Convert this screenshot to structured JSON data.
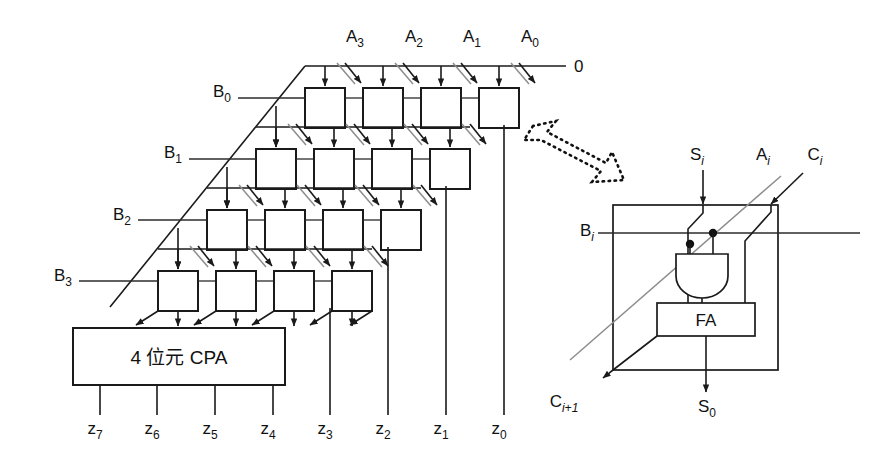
{
  "figure": {
    "type": "logic-block-diagram"
  },
  "array": {
    "a_inputs": [
      "A",
      "A",
      "A",
      "A"
    ],
    "a_labels": [
      {
        "base": "A",
        "sub": "3",
        "x": 355,
        "y": 42
      },
      {
        "base": "A",
        "sub": "2",
        "x": 414,
        "y": 42
      },
      {
        "base": "A",
        "sub": "1",
        "x": 472,
        "y": 42
      },
      {
        "base": "A",
        "sub": "0",
        "x": 530,
        "y": 42
      }
    ],
    "b_labels": [
      {
        "base": "B",
        "sub": "0",
        "x": 222,
        "y": 97
      },
      {
        "base": "B",
        "sub": "1",
        "x": 173,
        "y": 158
      },
      {
        "base": "B",
        "sub": "2",
        "x": 122,
        "y": 220
      },
      {
        "base": "B",
        "sub": "3",
        "x": 63,
        "y": 281
      }
    ],
    "carry_in_label": "0",
    "carry_in_x": 566,
    "carry_in_y": 66,
    "rows": 4,
    "cols": 4,
    "cell_size": 40,
    "row_pitch": 61,
    "col_pitch": 58,
    "row_x_offset": -49,
    "row0_x": 305,
    "row0_y": 88
  },
  "cpa": {
    "label": "4 位元 CPA",
    "x": 73,
    "y": 328,
    "width": 212,
    "height": 57
  },
  "outputs": {
    "labels": [
      {
        "base": "z",
        "sub": "7",
        "x": 95,
        "y": 434,
        "line_x": 100,
        "line_top": 385
      },
      {
        "base": "z",
        "sub": "6",
        "x": 152,
        "y": 434,
        "line_x": 157,
        "line_top": 385
      },
      {
        "base": "z",
        "sub": "5",
        "x": 210,
        "y": 434,
        "line_x": 215,
        "line_top": 385
      },
      {
        "base": "z",
        "sub": "4",
        "x": 268,
        "y": 434,
        "line_x": 273,
        "line_top": 385
      },
      {
        "base": "z",
        "sub": "3",
        "x": 325,
        "y": 434,
        "line_x": 330,
        "line_top": 308
      },
      {
        "base": "z",
        "sub": "2",
        "x": 383,
        "y": 434,
        "line_x": 388,
        "line_top": 247
      },
      {
        "base": "z",
        "sub": "1",
        "x": 441,
        "y": 434,
        "line_x": 446,
        "line_top": 186
      },
      {
        "base": "z",
        "sub": "0",
        "x": 499,
        "y": 434,
        "line_x": 504,
        "line_top": 125
      }
    ]
  },
  "callout": {
    "arrow_name": "zoom-callout-arrow",
    "from_x": 530,
    "from_y": 130,
    "to_x": 625,
    "to_y": 175
  },
  "cell_detail": {
    "box": {
      "x": 613,
      "y": 205,
      "width": 165,
      "height": 165
    },
    "fa_label": "FA",
    "fa_box": {
      "x": 657,
      "y": 303,
      "width": 98,
      "height": 33
    },
    "and_gate": {
      "x": 676,
      "y": 254,
      "width": 52,
      "height": 44
    },
    "labels": {
      "s_in": {
        "base": "S",
        "sub": "i",
        "italic_sub": true,
        "x": 697,
        "y": 160
      },
      "a_in": {
        "base": "A",
        "sub": "i",
        "italic_sub": true,
        "x": 763,
        "y": 160
      },
      "c_in": {
        "base": "C",
        "sub": "i",
        "italic_sub": true,
        "x": 815,
        "y": 160
      },
      "b_in": {
        "base": "B",
        "sub": "i",
        "italic_sub": true,
        "x": 587,
        "y": 236
      },
      "c_out": {
        "base": "C",
        "sub": "i+1",
        "italic_sub": true,
        "x": 564,
        "y": 407
      },
      "s_out": {
        "base": "S",
        "sub": "0",
        "italic_sub": false,
        "x": 707,
        "y": 412
      }
    }
  },
  "colors": {
    "ink": "#1a1a1a",
    "grey_wire": "#8d8d8d",
    "background": "#ffffff"
  }
}
